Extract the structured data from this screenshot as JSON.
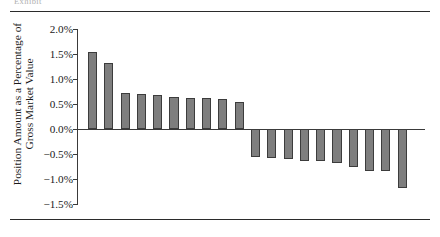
{
  "figure": {
    "caption_remnant": "Exhibit",
    "rules": {
      "top": true,
      "bottom": true
    }
  },
  "axis": {
    "y_title_line1": "Position Amount as a Percentage of",
    "y_title_line2": "Gross Market Value"
  },
  "chart_data": {
    "type": "bar",
    "title": "",
    "subtitle": "",
    "xlabel": "",
    "ylabel": "Position Amount as a Percentage of Gross Market Value",
    "ylim": [
      -1.5,
      2.0
    ],
    "ytick_values": [
      2.0,
      1.5,
      1.0,
      0.5,
      0.0,
      -0.5,
      -1.0,
      -1.5
    ],
    "ytick_labels": [
      "2.0%",
      "1.5%",
      "1.0%",
      "0.5%",
      "0.0%",
      "-0.5%",
      "-1.0%",
      "-1.5%"
    ],
    "xtick_labels": [],
    "grid": false,
    "legend": null,
    "bar_color": "#7e7e7e",
    "bar_edge_color": "#3c3c3c",
    "categories": [
      "1",
      "2",
      "3",
      "4",
      "5",
      "6",
      "7",
      "8",
      "9",
      "10",
      "11",
      "12",
      "13",
      "14",
      "15",
      "16",
      "17",
      "18",
      "19",
      "20"
    ],
    "values": [
      1.54,
      1.33,
      0.73,
      0.71,
      0.68,
      0.65,
      0.63,
      0.62,
      0.6,
      0.55,
      -0.56,
      -0.58,
      -0.59,
      -0.63,
      -0.63,
      -0.67,
      -0.76,
      -0.84,
      -0.84,
      -1.17
    ],
    "units": "percent"
  }
}
